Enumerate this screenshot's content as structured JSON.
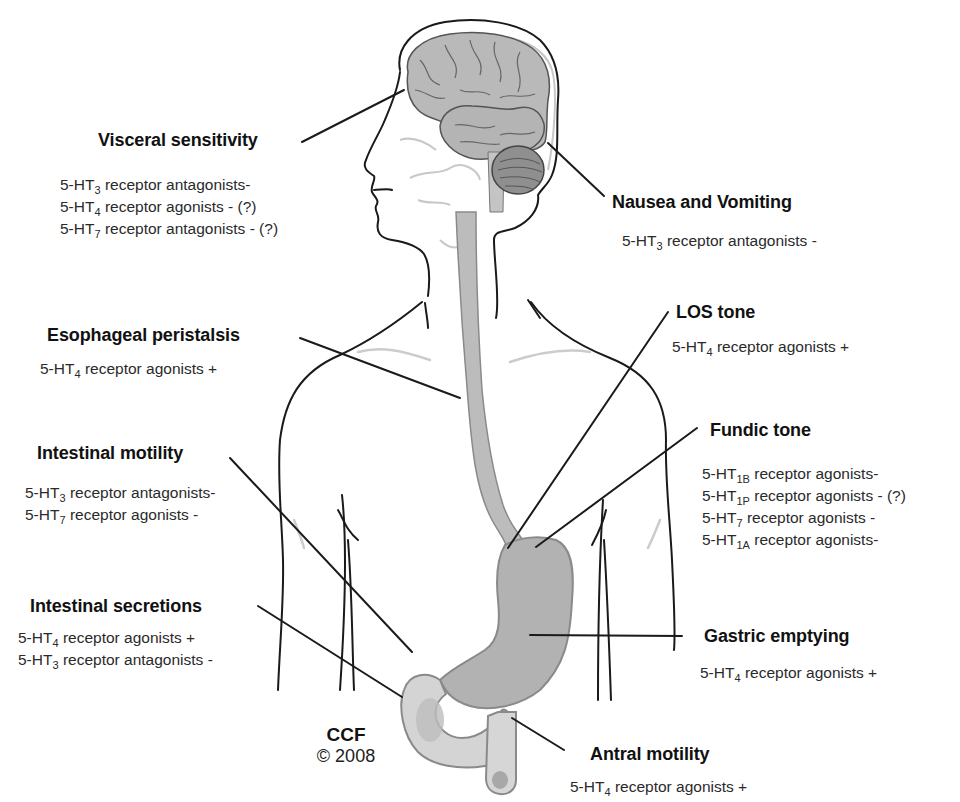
{
  "figure": {
    "colors": {
      "background": "#ffffff",
      "outline": "#1a1a1a",
      "organ_fill": "#b9b9b9",
      "organ_light": "#d8d8d8",
      "cerebellum": "#8f8f8f",
      "faint_lines": "#c8c8c8"
    }
  },
  "labels": {
    "visceral": {
      "title": "Visceral sensitivity",
      "lines": [
        {
          "prefix": "5-HT",
          "sub": "3",
          "text": " receptor antagonists-"
        },
        {
          "prefix": "5-HT",
          "sub": "4",
          "text": " receptor agonists - (?)"
        },
        {
          "prefix": "5-HT",
          "sub": "7",
          "text": " receptor antagonists - (?)"
        }
      ]
    },
    "nausea": {
      "title": "Nausea and Vomiting",
      "lines": [
        {
          "prefix": "5-HT",
          "sub": "3",
          "text": " receptor antagonists -"
        }
      ]
    },
    "esophageal": {
      "title": "Esophageal peristalsis",
      "lines": [
        {
          "prefix": "5-HT",
          "sub": "4",
          "text": " receptor agonists +"
        }
      ]
    },
    "los": {
      "title": "LOS tone",
      "lines": [
        {
          "prefix": "5-HT",
          "sub": "4",
          "text": " receptor agonists +"
        }
      ]
    },
    "intestinal_motility": {
      "title": "Intestinal motility",
      "lines": [
        {
          "prefix": "5-HT",
          "sub": "3",
          "text": " receptor antagonists-"
        },
        {
          "prefix": "5-HT",
          "sub": "7",
          "text": " receptor agonists -"
        }
      ]
    },
    "fundic": {
      "title": "Fundic tone",
      "lines": [
        {
          "prefix": "5-HT",
          "sub": "1B",
          "text": " receptor agonists-"
        },
        {
          "prefix": "5-HT",
          "sub": "1P",
          "text": " receptor agonists - (?)"
        },
        {
          "prefix": "5-HT",
          "sub": "7",
          "text": " receptor agonists -"
        },
        {
          "prefix": "5-HT",
          "sub": "1A",
          "text": " receptor agonists-"
        }
      ]
    },
    "intestinal_secretions": {
      "title": "Intestinal secretions",
      "lines": [
        {
          "prefix": "5-HT",
          "sub": "4",
          "text": " receptor agonists +"
        },
        {
          "prefix": "5-HT",
          "sub": "3",
          "text": " receptor antagonists -"
        }
      ]
    },
    "gastric_emptying": {
      "title": "Gastric emptying",
      "lines": [
        {
          "prefix": "5-HT",
          "sub": "4",
          "text": " receptor agonists +"
        }
      ]
    },
    "antral": {
      "title": "Antral motility",
      "lines": [
        {
          "prefix": "5-HT",
          "sub": "4",
          "text": " receptor agonists +"
        }
      ]
    }
  },
  "credit": {
    "org": "CCF",
    "year": "© 2008"
  }
}
